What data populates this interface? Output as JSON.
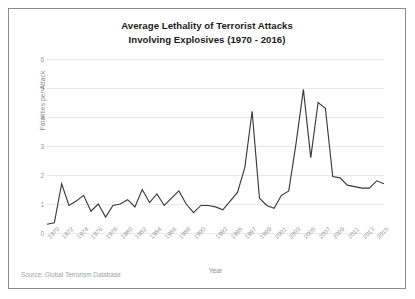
{
  "figure": {
    "title_line1": "Average Lethality of Terrorist Attacks",
    "title_line2": "Involving Explosives (1970 - 2016)",
    "source_note": "Source: Global Terrorism Database",
    "frame_color": "#8c8c8c",
    "line_color": "#3a3a3a",
    "grid_color": "#e9e9e9",
    "tick_text_color": "#9a9a9a",
    "axis_title_color": "#8f8f8f",
    "title_color": "#1b1b1b"
  },
  "chart_data": {
    "type": "line",
    "title": "Average Lethality of Terrorist Attacks Involving Explosives (1970 - 2016)",
    "xlabel": "Year",
    "ylabel": "Fatalities per Attack",
    "xlim": [
      1970,
      2016
    ],
    "ylim": [
      0,
      6
    ],
    "grid": true,
    "legend": false,
    "ytick_labels": [
      "0",
      "1",
      "2",
      "3",
      "4",
      "5",
      "6"
    ],
    "ytick_values": [
      0,
      1,
      2,
      3,
      4,
      5,
      6
    ],
    "xtick_labels": [
      "1970",
      "1972",
      "1974",
      "1976",
      "1978",
      "1980",
      "1982",
      "1984",
      "1986",
      "1988",
      "1990",
      "1993",
      "1995",
      "1997",
      "1999",
      "2001",
      "2003",
      "2005",
      "2007",
      "2009",
      "2011",
      "2013",
      "2015"
    ],
    "x": [
      1970,
      1971,
      1972,
      1973,
      1974,
      1975,
      1976,
      1977,
      1978,
      1979,
      1980,
      1981,
      1982,
      1983,
      1984,
      1985,
      1986,
      1987,
      1988,
      1989,
      1990,
      1991,
      1992,
      1993,
      1994,
      1995,
      1996,
      1997,
      1998,
      1999,
      2000,
      2001,
      2002,
      2003,
      2004,
      2005,
      2006,
      2007,
      2008,
      2009,
      2010,
      2011,
      2012,
      2013,
      2014,
      2015,
      2016
    ],
    "values": [
      0.3,
      0.35,
      1.7,
      0.95,
      1.1,
      1.3,
      0.75,
      1.0,
      0.55,
      0.95,
      1.0,
      1.15,
      0.9,
      1.5,
      1.05,
      1.35,
      0.95,
      1.2,
      1.45,
      1.0,
      0.7,
      0.95,
      0.95,
      0.9,
      0.8,
      1.1,
      1.4,
      2.25,
      4.2,
      1.2,
      0.95,
      0.85,
      1.3,
      1.45,
      3.1,
      4.95,
      2.6,
      4.5,
      4.3,
      1.95,
      1.9,
      1.65,
      1.6,
      1.55,
      1.55,
      1.8,
      1.7
    ],
    "series": [
      {
        "name": "Fatalities per Attack",
        "values": [
          0.3,
          0.35,
          1.7,
          0.95,
          1.1,
          1.3,
          0.75,
          1.0,
          0.55,
          0.95,
          1.0,
          1.15,
          0.9,
          1.5,
          1.05,
          1.35,
          0.95,
          1.2,
          1.45,
          1.0,
          0.7,
          0.95,
          0.95,
          0.9,
          0.8,
          1.1,
          1.4,
          2.25,
          4.2,
          1.2,
          0.95,
          0.85,
          1.3,
          1.45,
          3.1,
          4.95,
          2.6,
          4.5,
          4.3,
          1.95,
          1.9,
          1.65,
          1.6,
          1.55,
          1.55,
          1.8,
          1.7
        ]
      }
    ]
  }
}
